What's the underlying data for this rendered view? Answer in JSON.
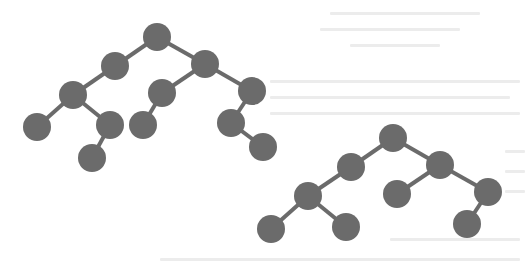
{
  "diagram": {
    "type": "tree",
    "node_color": "#6b6b6b",
    "edge_color": "#6b6b6b",
    "node_radius": 14,
    "edge_width": 4,
    "background": "#ffffff",
    "trees": [
      {
        "name": "tree-1",
        "nodes": [
          {
            "id": "a",
            "x": 157,
            "y": 37
          },
          {
            "id": "b",
            "x": 115,
            "y": 66
          },
          {
            "id": "c",
            "x": 205,
            "y": 64
          },
          {
            "id": "d",
            "x": 73,
            "y": 95
          },
          {
            "id": "e",
            "x": 162,
            "y": 93
          },
          {
            "id": "f",
            "x": 252,
            "y": 91
          },
          {
            "id": "g",
            "x": 37,
            "y": 127
          },
          {
            "id": "h",
            "x": 110,
            "y": 125
          },
          {
            "id": "i",
            "x": 143,
            "y": 125
          },
          {
            "id": "j",
            "x": 231,
            "y": 123
          },
          {
            "id": "k",
            "x": 92,
            "y": 158
          },
          {
            "id": "l",
            "x": 263,
            "y": 147
          }
        ],
        "edges": [
          [
            "a",
            "b"
          ],
          [
            "a",
            "c"
          ],
          [
            "b",
            "d"
          ],
          [
            "c",
            "e"
          ],
          [
            "c",
            "f"
          ],
          [
            "d",
            "g"
          ],
          [
            "d",
            "h"
          ],
          [
            "e",
            "i"
          ],
          [
            "f",
            "j"
          ],
          [
            "h",
            "k"
          ],
          [
            "j",
            "l"
          ]
        ]
      },
      {
        "name": "tree-2",
        "nodes": [
          {
            "id": "a",
            "x": 393,
            "y": 138
          },
          {
            "id": "b",
            "x": 351,
            "y": 167
          },
          {
            "id": "c",
            "x": 440,
            "y": 165
          },
          {
            "id": "d",
            "x": 308,
            "y": 196
          },
          {
            "id": "e",
            "x": 397,
            "y": 194
          },
          {
            "id": "f",
            "x": 488,
            "y": 192
          },
          {
            "id": "g",
            "x": 271,
            "y": 229
          },
          {
            "id": "h",
            "x": 346,
            "y": 227
          },
          {
            "id": "i",
            "x": 467,
            "y": 224
          }
        ],
        "edges": [
          [
            "a",
            "b"
          ],
          [
            "a",
            "c"
          ],
          [
            "b",
            "d"
          ],
          [
            "c",
            "e"
          ],
          [
            "c",
            "f"
          ],
          [
            "d",
            "g"
          ],
          [
            "d",
            "h"
          ],
          [
            "f",
            "i"
          ]
        ]
      }
    ]
  }
}
